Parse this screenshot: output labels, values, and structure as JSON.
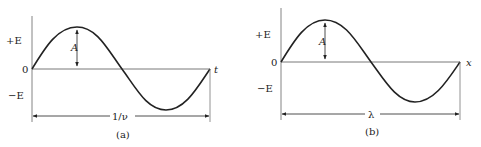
{
  "panels": [
    {
      "id": "a",
      "caption": "(a)",
      "y_labels": {
        "pos": "+E",
        "zero": "0",
        "neg": "−E"
      },
      "axis_label": "t",
      "amplitude_label": "A",
      "span_label": "1/ν"
    },
    {
      "id": "b",
      "caption": "(b)",
      "y_labels": {
        "pos": "+E",
        "zero": "0",
        "neg": "−E"
      },
      "axis_label": "x",
      "amplitude_label": "A",
      "span_label": "λ"
    }
  ],
  "colors": {
    "line": "#222222",
    "axis": "#555555",
    "background": "#ffffff"
  }
}
